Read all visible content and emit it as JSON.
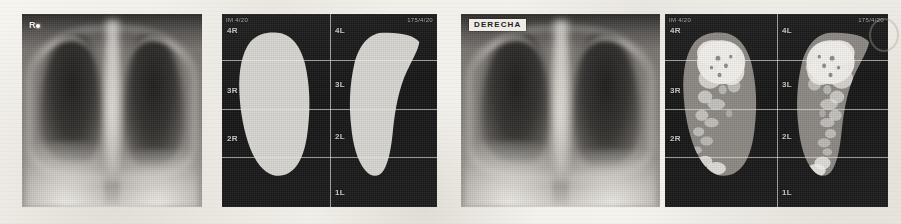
{
  "figure": {
    "caption": "",
    "background_color": "#f4f2ed",
    "panel_count": 4
  },
  "panels": [
    {
      "id": "panel-1",
      "kind": "chest-radiograph",
      "position": "first",
      "side_marker": "R",
      "annotation_label": "",
      "corner_text_left": "",
      "corner_text_right": "",
      "zone_labels_right_lung": [],
      "zone_labels_left_lung": []
    },
    {
      "id": "panel-2",
      "kind": "lung-segmentation-mask",
      "position": "second",
      "side_marker": "",
      "annotation_label": "",
      "corner_text_left": "IM 4/20",
      "corner_text_right": "175/4/20",
      "zone_labels_right_lung": [
        "4R",
        "3R",
        "2R"
      ],
      "zone_labels_left_lung": [
        "4L",
        "3L",
        "2L",
        "1L"
      ]
    },
    {
      "id": "panel-3",
      "kind": "chest-radiograph",
      "position": "third",
      "side_marker": "",
      "annotation_label": "DERECHA",
      "corner_text_left": "",
      "corner_text_right": "",
      "zone_labels_right_lung": [],
      "zone_labels_left_lung": []
    },
    {
      "id": "panel-4",
      "kind": "lung-perfusion-overlay",
      "position": "fourth",
      "side_marker": "",
      "annotation_label": "",
      "corner_text_left": "IM 4/20",
      "corner_text_right": "175/4/20",
      "zone_labels_right_lung": [
        "4R",
        "3R",
        "2R"
      ],
      "zone_labels_left_lung": [
        "4L",
        "3L",
        "2L",
        "1L"
      ]
    }
  ],
  "colors": {
    "paper": "#f4f2ed",
    "mask_fill": "#d8d6d1",
    "mask_background": "#161616",
    "overlay_gray": "#8b8884",
    "overlay_highlight": "#f3f1ec",
    "grid_line": "#f3f1ec",
    "annotation_box_bg": "#efece6",
    "annotation_box_text": "#23211f"
  }
}
